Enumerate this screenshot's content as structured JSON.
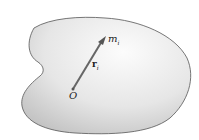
{
  "diagram": {
    "labels": {
      "particle_symbol": "m",
      "particle_subscript": "i",
      "vector_symbol": "r",
      "vector_subscript": "i",
      "origin": "O"
    },
    "colors": {
      "body_outline": "#555555",
      "body_fill_light": "#fafafa",
      "body_fill_dark": "#c8c8c8",
      "arrow": "#555555"
    }
  }
}
